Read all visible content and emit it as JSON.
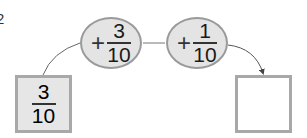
{
  "problem": {
    "number": "2"
  },
  "diagram": {
    "start": {
      "numerator": "3",
      "denominator": "10"
    },
    "operations": [
      {
        "sign": "+",
        "numerator": "3",
        "denominator": "10"
      },
      {
        "sign": "+",
        "numerator": "1",
        "denominator": "10"
      }
    ],
    "result": {
      "value": ""
    }
  },
  "colors": {
    "circle_fill": "#e4e4e4",
    "border": "#9a9a9a",
    "start_box_fill": "#e6e6e6",
    "line": "#555555"
  }
}
